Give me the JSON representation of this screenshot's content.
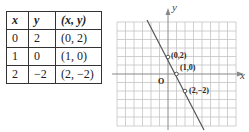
{
  "table": {
    "headers": [
      "x",
      "y",
      "(x, y)"
    ],
    "rows": [
      [
        "0",
        "2",
        "(0, 2)"
      ],
      [
        "1",
        "0",
        "(1, 0)"
      ],
      [
        "2",
        "−2",
        "(2, −2)"
      ]
    ]
  },
  "graph": {
    "x_axis_label": "x",
    "y_axis_label": "y",
    "origin_label": "O",
    "points": [
      {
        "label": "(0,2)",
        "x": 0,
        "y": 2
      },
      {
        "label": "(1,0)",
        "x": 1,
        "y": 0
      },
      {
        "label": "(2,−2)",
        "x": 2,
        "y": -2
      }
    ],
    "line_equation": "y = -2x + 2",
    "grid_color": "#bfbfbf",
    "line_color": "#555555"
  }
}
